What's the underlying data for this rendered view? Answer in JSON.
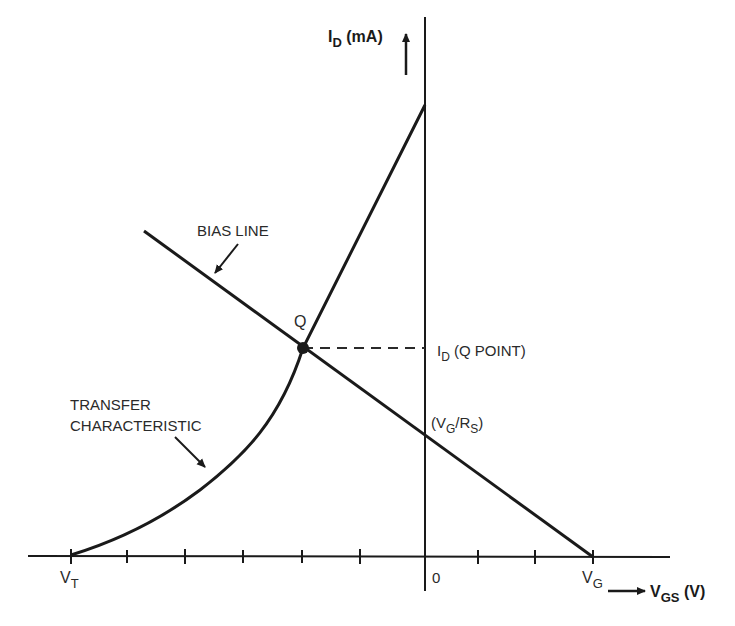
{
  "diagram": {
    "type": "JFET/MOSFET transfer characteristic with bias line",
    "axes": {
      "y_label_main": "I",
      "y_label_sub": "D",
      "y_label_unit": " (mA)",
      "x_label_main": "V",
      "x_label_sub": "GS",
      "x_label_unit": " (V)",
      "origin_label": "0"
    },
    "x_ticks": {
      "vt_main": "V",
      "vt_sub": "T",
      "vg_main": "V",
      "vg_sub": "G"
    },
    "labels": {
      "bias_line": "BIAS LINE",
      "q": "Q",
      "transfer_1": "TRANSFER",
      "transfer_2": "CHARACTERISTIC",
      "id_q_main": "I",
      "id_q_sub": "D",
      "id_q_rest": " (Q POINT)",
      "intercept_open": "(V",
      "intercept_sub_g": "G",
      "intercept_mid": "/R",
      "intercept_sub_s": "S",
      "intercept_close": ")"
    },
    "colors": {
      "ink": "#1a1a1a",
      "background": "#ffffff"
    }
  }
}
